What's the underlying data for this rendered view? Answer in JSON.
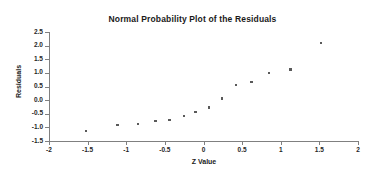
{
  "chart_data": {
    "type": "scatter",
    "title": "Normal Probability Plot of the Residuals",
    "xlabel": "Z Value",
    "ylabel": "Residuals",
    "xlim": [
      -2,
      2
    ],
    "ylim": [
      -1.5,
      2.5
    ],
    "xticks": [
      "-2",
      "-1.5",
      "-1",
      "-0.5",
      "0",
      "0.5",
      "1",
      "1.5",
      "2"
    ],
    "xtick_values": [
      -2,
      -1.5,
      -1,
      -0.5,
      0,
      0.5,
      1,
      1.5,
      2
    ],
    "yticks": [
      "2.5",
      "2.0",
      "1.5",
      "1.0",
      "0.5",
      "0.0",
      "-0.5",
      "-1.0",
      "-1.5"
    ],
    "ytick_values": [
      2.5,
      2.0,
      1.5,
      1.0,
      0.5,
      0.0,
      -0.5,
      -1.0,
      -1.5
    ],
    "grid": false,
    "legend": false,
    "marker_color": "#595959",
    "axis_color": "#808080",
    "series": [
      {
        "name": "Residuals",
        "points": [
          {
            "x": -1.52,
            "y": -1.14
          },
          {
            "x": -1.11,
            "y": -0.91
          },
          {
            "x": -0.85,
            "y": -0.87
          },
          {
            "x": -0.62,
            "y": -0.76
          },
          {
            "x": -0.44,
            "y": -0.73
          },
          {
            "x": -0.25,
            "y": -0.58
          },
          {
            "x": -0.1,
            "y": -0.43
          },
          {
            "x": 0.07,
            "y": -0.28
          },
          {
            "x": 0.24,
            "y": 0.06
          },
          {
            "x": 0.42,
            "y": 0.55
          },
          {
            "x": 0.62,
            "y": 0.66
          },
          {
            "x": 0.85,
            "y": 1.0
          },
          {
            "x": 1.13,
            "y": 1.12
          },
          {
            "x": 1.52,
            "y": 2.1
          }
        ]
      }
    ]
  }
}
